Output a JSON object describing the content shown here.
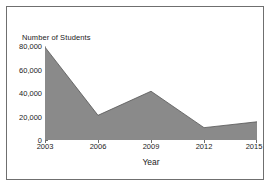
{
  "chart_data": {
    "type": "area",
    "title": "",
    "xlabel": "Year",
    "ylabel": "Number of Students",
    "categories": [
      "2003",
      "2006",
      "2009",
      "2012",
      "2015"
    ],
    "x": [
      2003,
      2006,
      2009,
      2012,
      2015
    ],
    "values": [
      79000,
      21000,
      41500,
      10500,
      15500
    ],
    "series": [
      {
        "name": "Number of Students",
        "values": [
          79000,
          21000,
          41500,
          10500,
          15500
        ]
      }
    ],
    "xlim": [
      2003,
      2015
    ],
    "ylim": [
      0,
      80000
    ],
    "ytick_labels": [
      "0",
      "20,000",
      "40,000",
      "60,000",
      "80,000"
    ],
    "ytick_values": [
      0,
      20000,
      40000,
      60000,
      80000
    ],
    "xtick_labels": [
      "2003",
      "2006",
      "2009",
      "2012",
      "2015"
    ],
    "grid": false,
    "legend": false,
    "legend_position": "none",
    "fill_color": "#8a8a8a",
    "line_color": "#555555",
    "axis_color": "#6d6d6d",
    "background_color": "#ffffff",
    "frame_color": "#6f6f6f"
  }
}
